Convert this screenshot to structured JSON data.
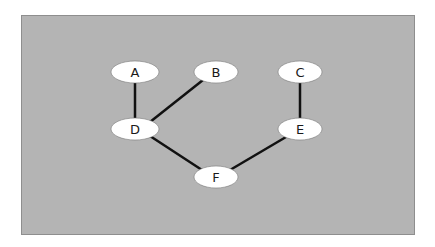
{
  "diagram": {
    "type": "graph",
    "colors": {
      "background": "#b4b4b4",
      "node_fill": "#ffffff",
      "edge": "#111111"
    },
    "nodes": [
      {
        "id": "A",
        "label": "A",
        "cx": 135,
        "cy": 72
      },
      {
        "id": "B",
        "label": "B",
        "cx": 216,
        "cy": 72
      },
      {
        "id": "C",
        "label": "C",
        "cx": 300,
        "cy": 72
      },
      {
        "id": "D",
        "label": "D",
        "cx": 135,
        "cy": 129
      },
      {
        "id": "E",
        "label": "E",
        "cx": 300,
        "cy": 129
      },
      {
        "id": "F",
        "label": "F",
        "cx": 216,
        "cy": 177
      }
    ],
    "edges": [
      {
        "from": "A",
        "to": "D"
      },
      {
        "from": "B",
        "to": "D"
      },
      {
        "from": "C",
        "to": "E"
      },
      {
        "from": "D",
        "to": "F"
      },
      {
        "from": "E",
        "to": "F"
      }
    ]
  }
}
